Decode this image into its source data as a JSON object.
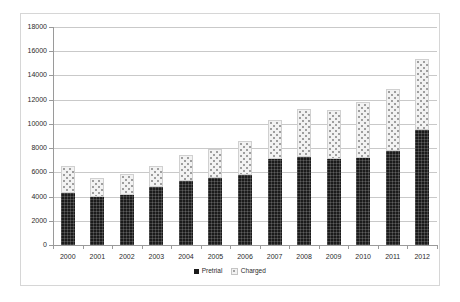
{
  "chart_data": {
    "type": "bar",
    "subtype": "stacked-column",
    "title": "",
    "xlabel": "",
    "ylabel": "",
    "categories": [
      "2000",
      "2001",
      "2002",
      "2003",
      "2004",
      "2005",
      "2006",
      "2007",
      "2008",
      "2009",
      "2010",
      "2011",
      "2012"
    ],
    "series": [
      {
        "name": "Pretrial",
        "color": "#1b1b1b",
        "values": [
          4300,
          3950,
          4100,
          4750,
          5250,
          5500,
          5750,
          7100,
          7300,
          7100,
          7200,
          7800,
          9500
        ]
      },
      {
        "name": "Charged",
        "color": "#f2f2f2",
        "values": [
          2250,
          1600,
          1800,
          1750,
          2150,
          2400,
          2850,
          3200,
          3900,
          4050,
          4600,
          5100,
          5850
        ]
      }
    ],
    "totals": [
      6550,
      5550,
      5900,
      6500,
      7400,
      7900,
      8600,
      10300,
      11200,
      11150,
      11800,
      12900,
      15350
    ],
    "ylim": [
      0,
      18000
    ],
    "ytick_step": 2000,
    "ytick_labels": [
      "0",
      "2000",
      "4000",
      "6000",
      "8000",
      "10000",
      "12000",
      "14000",
      "16000",
      "18000"
    ],
    "grid": true,
    "grid_axis": "y",
    "legend_position": "bottom",
    "legend": [
      {
        "label": "Pretrial",
        "swatch": "pretrial-swatch"
      },
      {
        "label": "Charged",
        "swatch": "charged-swatch"
      }
    ]
  }
}
